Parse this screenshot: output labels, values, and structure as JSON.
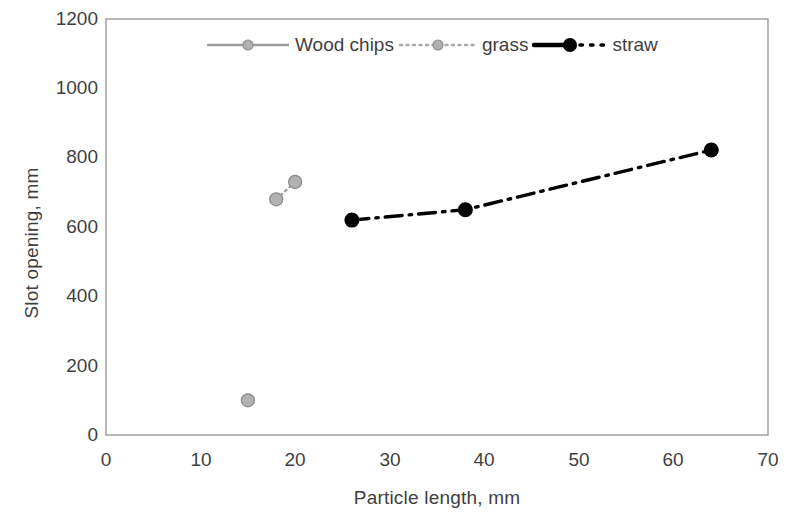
{
  "chart_data": {
    "type": "scatter",
    "title": "",
    "xlabel": "Particle length, mm",
    "ylabel": "Slot opening, mm",
    "xlim": [
      0,
      70
    ],
    "ylim": [
      0,
      1200
    ],
    "xticks": [
      0,
      10,
      20,
      30,
      40,
      50,
      60,
      70
    ],
    "yticks": [
      0,
      200,
      400,
      600,
      800,
      1000,
      1200
    ],
    "grid": false,
    "legend_position": "top-center",
    "series": [
      {
        "name": "Wood chips",
        "color": "#9c9c9c",
        "linestyle": "solid",
        "marker": "circle",
        "x": [
          15
        ],
        "y": [
          100
        ]
      },
      {
        "name": "grass",
        "color": "#9c9c9c",
        "linestyle": "dotted",
        "marker": "circle",
        "x": [
          18,
          20
        ],
        "y": [
          680,
          730
        ]
      },
      {
        "name": "straw",
        "color": "#000000",
        "linestyle": "dashdot",
        "marker": "circle",
        "x": [
          26,
          38,
          64
        ],
        "y": [
          620,
          650,
          822
        ]
      }
    ]
  },
  "axes": {
    "y_title": "Slot opening, mm",
    "x_title": "Particle length, mm",
    "y_tick_labels": [
      "1200",
      "1000",
      "800",
      "600",
      "400",
      "200",
      "0"
    ],
    "x_tick_labels": [
      "0",
      "10",
      "20",
      "30",
      "40",
      "50",
      "60",
      "70"
    ]
  },
  "legend": {
    "items": [
      {
        "label": "Wood chips",
        "color": "#9c9c9c",
        "style": "solid"
      },
      {
        "label": "grass",
        "color": "#9c9c9c",
        "style": "dotted"
      },
      {
        "label": "straw",
        "color": "#000000",
        "style": "dashdot"
      }
    ]
  },
  "colors": {
    "gray_series": "#9c9c9c",
    "black_series": "#000000",
    "frame": "#808080",
    "text": "#3f3f3f",
    "background": "#ffffff"
  }
}
